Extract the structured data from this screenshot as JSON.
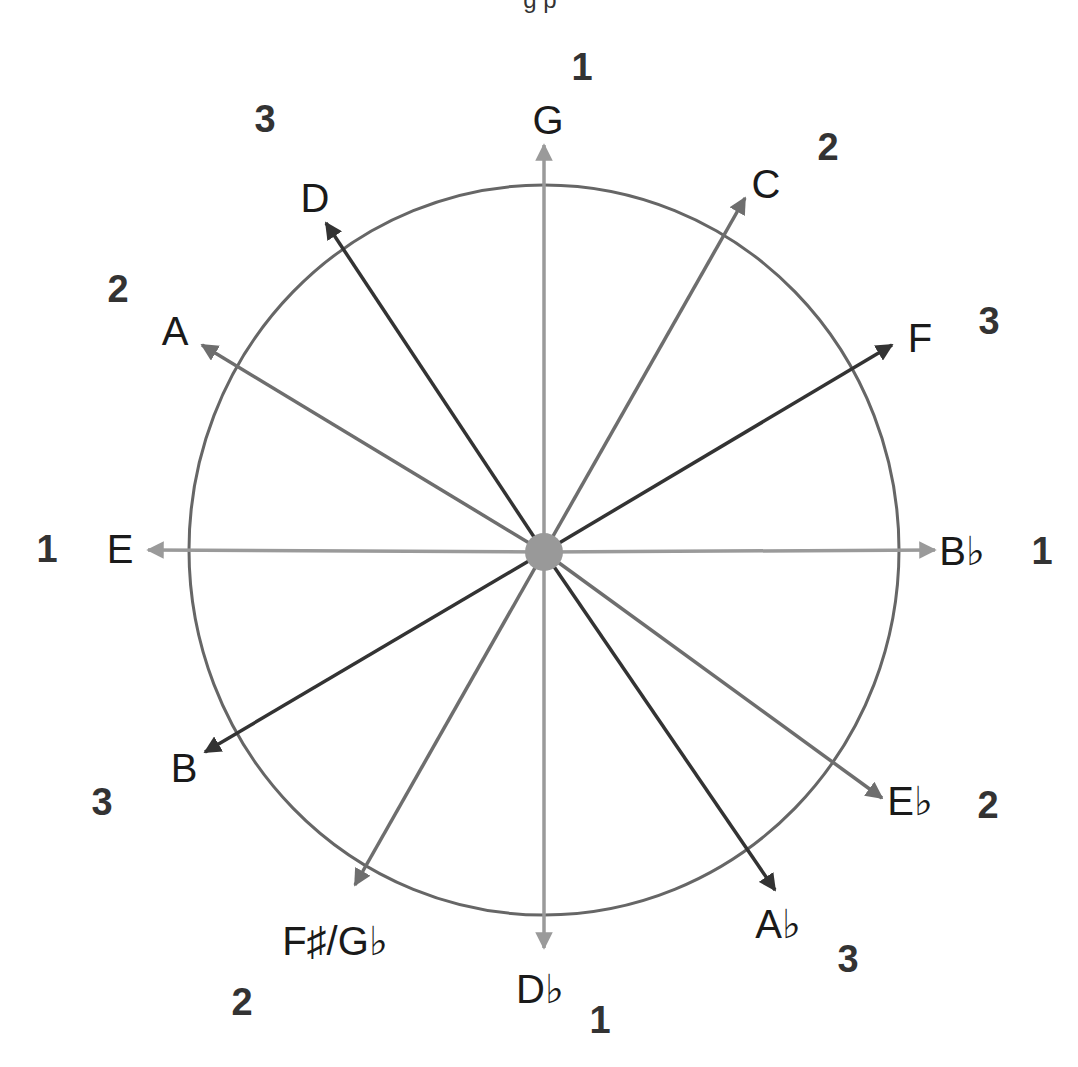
{
  "caption_partial": "g p",
  "colors": {
    "group1": "#9a9a9a",
    "group2": "#6e6e6e",
    "group3": "#333333",
    "circle": "#666666",
    "center_dot": "#999999",
    "text": "#1a1a1a"
  },
  "circle": {
    "cx": 544,
    "cy": 550,
    "rx": 355,
    "ry": 365
  },
  "center": {
    "x": 544,
    "y": 552,
    "r": 19
  },
  "notes": [
    {
      "label": "G",
      "group": 1,
      "tip": [
        544,
        145
      ],
      "label_pos": [
        548,
        134
      ],
      "group_label": "1",
      "group_pos": [
        582,
        80
      ]
    },
    {
      "label": "C",
      "group": 2,
      "tip": [
        745,
        198
      ],
      "label_pos": [
        766,
        198
      ],
      "group_label": "2",
      "group_pos": [
        828,
        160
      ]
    },
    {
      "label": "F",
      "group": 3,
      "tip": [
        892,
        345
      ],
      "label_pos": [
        920,
        352
      ],
      "group_label": "3",
      "group_pos": [
        989,
        334
      ]
    },
    {
      "label": "B♭",
      "group": 1,
      "tip": [
        935,
        550
      ],
      "label_pos": [
        962,
        565
      ],
      "group_label": "1",
      "group_pos": [
        1042,
        564
      ]
    },
    {
      "label": "E♭",
      "group": 2,
      "tip": [
        882,
        798
      ],
      "label_pos": [
        910,
        815
      ],
      "group_label": "2",
      "group_pos": [
        988,
        818
      ]
    },
    {
      "label": "A♭",
      "group": 3,
      "tip": [
        775,
        890
      ],
      "label_pos": [
        778,
        938
      ],
      "group_label": "3",
      "group_pos": [
        848,
        972
      ]
    },
    {
      "label": "D♭",
      "group": 1,
      "tip": [
        544,
        948
      ],
      "label_pos": [
        540,
        1003
      ],
      "group_label": "1",
      "group_pos": [
        600,
        1033
      ]
    },
    {
      "label": "F♯/G♭",
      "group": 2,
      "tip": [
        355,
        885
      ],
      "label_pos": [
        335,
        955
      ],
      "group_label": "2",
      "group_pos": [
        242,
        1015
      ]
    },
    {
      "label": "B",
      "group": 3,
      "tip": [
        205,
        752
      ],
      "label_pos": [
        184,
        782
      ],
      "group_label": "3",
      "group_pos": [
        102,
        815
      ]
    },
    {
      "label": "E",
      "group": 1,
      "tip": [
        148,
        550
      ],
      "label_pos": [
        120,
        563
      ],
      "group_label": "1",
      "group_pos": [
        47,
        562
      ]
    },
    {
      "label": "A",
      "group": 2,
      "tip": [
        202,
        345
      ],
      "label_pos": [
        175,
        345
      ],
      "group_label": "2",
      "group_pos": [
        118,
        302
      ]
    },
    {
      "label": "D",
      "group": 3,
      "tip": [
        326,
        223
      ],
      "label_pos": [
        315,
        212
      ],
      "group_label": "3",
      "group_pos": [
        265,
        132
      ]
    }
  ]
}
